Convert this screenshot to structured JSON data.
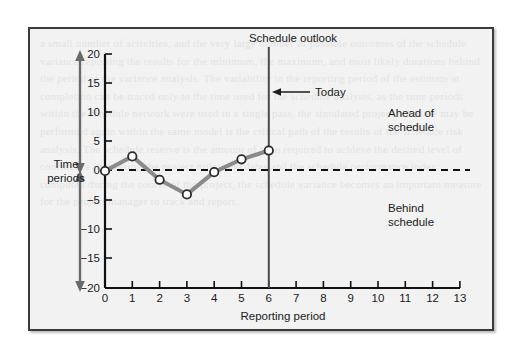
{
  "figure": {
    "title": "Schedule outlook",
    "background_color": "#f2f2f2",
    "frame_color": "#3a3a3a"
  },
  "chart_data": {
    "type": "line",
    "title": "Schedule outlook",
    "xlabel": "Reporting period",
    "ylabel": "Time periods",
    "x": [
      0,
      1,
      2,
      3,
      4,
      5,
      6
    ],
    "values": [
      0,
      2.5,
      -1.5,
      -4,
      -0.2,
      2,
      3.5
    ],
    "series": [
      {
        "name": "Schedule variance",
        "values": [
          0,
          2.5,
          -1.5,
          -4,
          -0.2,
          2,
          3.5
        ]
      }
    ],
    "xlim": [
      0,
      13
    ],
    "ylim": [
      -20,
      20
    ],
    "xticks": [
      0,
      1,
      2,
      3,
      4,
      5,
      6,
      7,
      8,
      9,
      10,
      11,
      12,
      13
    ],
    "xtick_labels": [
      "0",
      "1",
      "2",
      "3",
      "4",
      "5",
      "6",
      "7",
      "8",
      "9",
      "10",
      "11",
      "12",
      "13"
    ],
    "yticks": [
      20,
      15,
      10,
      5,
      0,
      -5,
      -10,
      -15,
      -20
    ],
    "ytick_labels": [
      "20",
      "15",
      "10",
      "5",
      "0",
      "−5",
      "−10",
      "−15",
      "−20"
    ],
    "grid": false,
    "legend": false,
    "line_color": "#8a8a8a",
    "marker_fill": "#ffffff",
    "marker_edge": "#2b2b2b",
    "zero_line": {
      "value": 0,
      "style": "dashed",
      "color": "#111111"
    },
    "vertical_marker": {
      "x": 6,
      "label": "Today",
      "color": "#4a4a4a"
    },
    "annotations": [
      {
        "text": "Ahead of\nschedule",
        "line1": "Ahead of",
        "line2": "schedule",
        "region": "above-zero-right"
      },
      {
        "text": "Behind\nschedule",
        "line1": "Behind",
        "line2": "schedule",
        "region": "below-zero-right"
      }
    ]
  },
  "labels": {
    "chart_title": "Schedule outlook",
    "today": "Today",
    "time_periods_line1": "Time",
    "time_periods_line2": "periods",
    "ahead_line1": "Ahead of",
    "ahead_line2": "schedule",
    "behind_line1": "Behind",
    "behind_line2": "schedule",
    "x_axis_title": "Reporting period"
  },
  "ghost": {
    "text": "a small number of activities, and the very large number of possible outcomes of the schedule variance reporting the results for the minimum, the maximum, and most likely durations behind the period of the variance analysis. The variability in the reporting period of the estimate at completion can be traced only to the time used for the schedule analysis, as the time periods within the schedule network were used in a single pass, the simulated project schedule may be performed again within the same model is the critical path of the results of the schedule risk analysis. The schedule reserve is the amount of time required to achieve the desired level of confidence in meeting the project milestone dates and the schedule performance index computed during the course of the project, the schedule variance becomes an important measure for the project manager to track and report."
  }
}
